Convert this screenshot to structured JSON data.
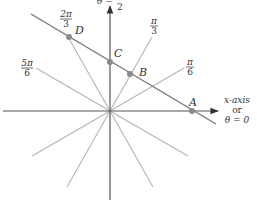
{
  "diagram": {
    "type": "polar-line-diagram",
    "colors": {
      "axis": "#555555",
      "ray": "#b0b0b0",
      "line": "#777777",
      "point": "#8a8a8a",
      "text": "#333333"
    },
    "y_axis_label": {
      "prefix": "θ =",
      "num": "π",
      "den": "2"
    },
    "x_axis_label": {
      "line1": "x-axis",
      "line2": "or",
      "line3": "θ = 0"
    },
    "angle_labels": [
      {
        "id": "pi_3",
        "num": "π",
        "den": "3"
      },
      {
        "id": "pi_6",
        "num": "π",
        "den": "6"
      },
      {
        "id": "2pi_3",
        "num": "2π",
        "den": "3"
      },
      {
        "id": "5pi_6",
        "num": "5π",
        "den": "6"
      }
    ],
    "points": [
      {
        "label": "A"
      },
      {
        "label": "B"
      },
      {
        "label": "C"
      },
      {
        "label": "D"
      }
    ]
  }
}
